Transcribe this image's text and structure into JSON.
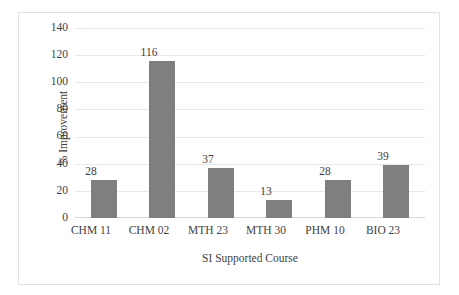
{
  "chart_data": {
    "type": "bar",
    "title": "",
    "subtitle": "",
    "xlabel": "SI Supported Course",
    "ylabel": "% Improvement",
    "categories": [
      "CHM 11",
      "CHM 02",
      "MTH 23",
      "MTH 30",
      "PHM 10",
      "BIO 23"
    ],
    "values": [
      28,
      116,
      37,
      13,
      28,
      39
    ],
    "data_labels": [
      "28",
      "116",
      "37",
      "13",
      "28",
      "39"
    ],
    "ylim": [
      0,
      140
    ],
    "ytick_values": [
      0,
      20,
      40,
      60,
      80,
      100,
      120,
      140
    ],
    "ytick_labels": [
      "0",
      "20",
      "40",
      "60",
      "80",
      "100",
      "120",
      "140"
    ],
    "grid": "horizontal",
    "legend": "none",
    "bar_color": "#7f7f7f",
    "gridline_color": "#e8e8e8",
    "background_color": "#ffffff",
    "border_color": "#e2e2e2",
    "text_color": "#3f3f3f"
  }
}
